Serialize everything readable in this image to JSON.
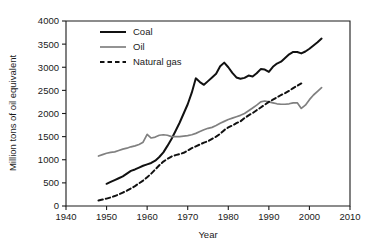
{
  "chart_data": {
    "type": "line",
    "title": "",
    "xlabel": "Year",
    "ylabel": "Million tons of oil equivalent",
    "xlim": [
      1940,
      2010
    ],
    "ylim": [
      0,
      4000
    ],
    "xticks": [
      1940,
      1950,
      1960,
      1970,
      1980,
      1990,
      2000,
      2010
    ],
    "yticks": [
      0,
      500,
      1000,
      1500,
      2000,
      2500,
      3000,
      3500,
      4000
    ],
    "grid": false,
    "legend_position": "top-left-inside",
    "series": [
      {
        "name": "Coal",
        "color": "#111111",
        "style": "solid",
        "x": [
          1950,
          1951,
          1952,
          1953,
          1954,
          1955,
          1956,
          1957,
          1958,
          1959,
          1960,
          1961,
          1962,
          1963,
          1964,
          1965,
          1966,
          1967,
          1968,
          1969,
          1970,
          1971,
          1972,
          1973,
          1974,
          1975,
          1976,
          1977,
          1978,
          1979,
          1980,
          1981,
          1982,
          1983,
          1984,
          1985,
          1986,
          1987,
          1988,
          1989,
          1990,
          1991,
          1992,
          1993,
          1994,
          1995,
          1996,
          1997,
          1998,
          1999,
          2000,
          2001,
          2002,
          2003
        ],
        "values": [
          480,
          520,
          560,
          600,
          640,
          700,
          760,
          790,
          830,
          870,
          900,
          930,
          980,
          1060,
          1160,
          1300,
          1450,
          1620,
          1800,
          2000,
          2200,
          2450,
          2760,
          2680,
          2620,
          2700,
          2780,
          2860,
          3020,
          3100,
          3000,
          2880,
          2780,
          2750,
          2770,
          2820,
          2800,
          2870,
          2960,
          2950,
          2900,
          3010,
          3080,
          3120,
          3200,
          3280,
          3330,
          3330,
          3300,
          3340,
          3400,
          3470,
          3540,
          3620
        ]
      },
      {
        "name": "Oil",
        "color": "#808080",
        "style": "solid",
        "x": [
          1948,
          1949,
          1950,
          1951,
          1952,
          1953,
          1954,
          1955,
          1956,
          1957,
          1958,
          1959,
          1960,
          1961,
          1962,
          1963,
          1964,
          1965,
          1966,
          1967,
          1968,
          1969,
          1970,
          1971,
          1972,
          1973,
          1974,
          1975,
          1976,
          1977,
          1978,
          1979,
          1980,
          1981,
          1982,
          1983,
          1984,
          1985,
          1986,
          1987,
          1988,
          1989,
          1990,
          1991,
          1992,
          1993,
          1994,
          1995,
          1996,
          1997,
          1998,
          1999,
          2000,
          2001,
          2002,
          2003
        ],
        "values": [
          1080,
          1110,
          1140,
          1160,
          1170,
          1200,
          1230,
          1250,
          1280,
          1300,
          1330,
          1380,
          1550,
          1470,
          1490,
          1530,
          1540,
          1530,
          1500,
          1500,
          1500,
          1510,
          1520,
          1540,
          1570,
          1610,
          1650,
          1680,
          1700,
          1740,
          1790,
          1830,
          1870,
          1900,
          1930,
          1960,
          2000,
          2060,
          2120,
          2180,
          2250,
          2270,
          2250,
          2230,
          2210,
          2200,
          2200,
          2210,
          2230,
          2230,
          2110,
          2180,
          2300,
          2400,
          2480,
          2560
        ]
      },
      {
        "name": "Natural gas",
        "color": "#111111",
        "style": "dashed",
        "x": [
          1948,
          1949,
          1950,
          1951,
          1952,
          1953,
          1954,
          1955,
          1956,
          1957,
          1958,
          1959,
          1960,
          1961,
          1962,
          1963,
          1964,
          1965,
          1966,
          1967,
          1968,
          1969,
          1970,
          1971,
          1972,
          1973,
          1974,
          1975,
          1976,
          1977,
          1978,
          1979,
          1980,
          1981,
          1982,
          1983,
          1984,
          1985,
          1986,
          1987,
          1988,
          1989,
          1990,
          1991,
          1992,
          1993,
          1994,
          1995,
          1996,
          1997,
          1998
        ],
        "values": [
          120,
          140,
          160,
          185,
          215,
          250,
          290,
          330,
          380,
          430,
          490,
          550,
          620,
          700,
          790,
          880,
          960,
          1020,
          1070,
          1100,
          1120,
          1150,
          1200,
          1250,
          1290,
          1330,
          1370,
          1400,
          1450,
          1500,
          1560,
          1640,
          1700,
          1740,
          1790,
          1830,
          1900,
          1960,
          2010,
          2070,
          2130,
          2190,
          2250,
          2300,
          2350,
          2400,
          2440,
          2490,
          2550,
          2600,
          2650
        ]
      }
    ]
  },
  "legend": {
    "items": [
      {
        "label": "Coal",
        "swatch": "solid-black-line-swatch"
      },
      {
        "label": "Oil",
        "swatch": "solid-gray-line-swatch"
      },
      {
        "label": "Natural gas",
        "swatch": "dashed-black-line-swatch"
      }
    ]
  },
  "axes": {
    "x_title": "Year",
    "y_title": "Million tons of oil equivalent",
    "x_tick_labels": [
      "1940",
      "1950",
      "1960",
      "1970",
      "1980",
      "1990",
      "2000",
      "2010"
    ],
    "y_tick_labels": [
      "0",
      "500",
      "1000",
      "1500",
      "2000",
      "2500",
      "3000",
      "3500",
      "4000"
    ]
  },
  "colors": {
    "coal": "#111111",
    "oil": "#808080",
    "natural_gas": "#111111",
    "axis": "#1a1a1a",
    "background": "#ffffff"
  }
}
